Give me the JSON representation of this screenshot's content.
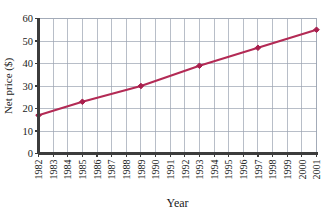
{
  "chart_data": {
    "type": "line",
    "title": "",
    "xlabel": "Year",
    "ylabel": "Net price ($)",
    "x": [
      1982,
      1983,
      1984,
      1985,
      1986,
      1987,
      1988,
      1989,
      1990,
      1991,
      1992,
      1993,
      1994,
      1995,
      1996,
      1997,
      1998,
      1999,
      2000,
      2001
    ],
    "xticklabels": [
      "1982",
      "1983",
      "1984",
      "1985",
      "1986",
      "1987",
      "1988",
      "1989",
      "1990",
      "1991",
      "1992",
      "1993",
      "1994",
      "1995",
      "1996",
      "1997",
      "1998",
      "1999",
      "2000",
      "2001"
    ],
    "yticklabels": [
      "0",
      "10",
      "20",
      "30",
      "40",
      "50",
      "60"
    ],
    "yticks": [
      0,
      10,
      20,
      30,
      40,
      50,
      60
    ],
    "ylim": [
      0,
      60
    ],
    "xlim": [
      1982,
      2001
    ],
    "grid": true,
    "legend": "none",
    "series": [
      {
        "name": "Net price",
        "color": "#b32a55",
        "marker": "diamond",
        "points": [
          {
            "x": 1982,
            "y": 17
          },
          {
            "x": 1985,
            "y": 23
          },
          {
            "x": 1989,
            "y": 30
          },
          {
            "x": 1993,
            "y": 39
          },
          {
            "x": 1997,
            "y": 47
          },
          {
            "x": 2001,
            "y": 55
          }
        ]
      }
    ]
  },
  "colors": {
    "line": "#b32a55",
    "marker": "#a81f4d",
    "grid": "#9aa3b0",
    "axis": "#3c3c3c",
    "background": "#ffffff",
    "text": "#1a1a1a"
  },
  "axes": {
    "y_axis_title": "Net price ($)",
    "x_axis_title": "Year"
  }
}
